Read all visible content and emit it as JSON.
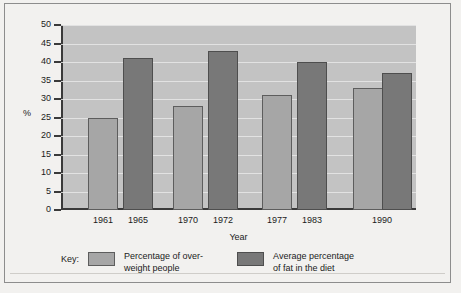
{
  "chart_data": {
    "type": "bar",
    "title": "",
    "xlabel": "Year",
    "ylabel": "%",
    "ylim": [
      0,
      50
    ],
    "ytick_step": 5,
    "yticks": [
      50,
      45,
      40,
      35,
      30,
      25,
      20,
      15,
      10,
      5,
      0
    ],
    "grid": true,
    "legend_position": "bottom",
    "legend_title": "Key:",
    "categories": [
      "1961",
      "1965",
      "1970",
      "1972",
      "1977",
      "1983",
      "1990"
    ],
    "series": [
      {
        "name": "Percentage of over-weight people",
        "color": "#a6a6a6",
        "points": [
          {
            "x": "1961",
            "y": 25
          },
          {
            "x": "1970",
            "y": 28
          },
          {
            "x": "1977",
            "y": 31
          },
          {
            "x": "1990",
            "y": 33
          }
        ]
      },
      {
        "name": "Average percentage of fat in the diet",
        "color": "#787878",
        "points": [
          {
            "x": "1965",
            "y": 41
          },
          {
            "x": "1972",
            "y": 43
          },
          {
            "x": "1983",
            "y": 40
          },
          {
            "x": "1990",
            "y": 37
          }
        ]
      }
    ],
    "bars": [
      {
        "label": "1961",
        "value": 25,
        "series": "light"
      },
      {
        "label": "1965",
        "value": 41,
        "series": "dark"
      },
      {
        "label": "1970",
        "value": 28,
        "series": "light"
      },
      {
        "label": "1972",
        "value": 43,
        "series": "dark"
      },
      {
        "label": "1977",
        "value": 31,
        "series": "light"
      },
      {
        "label": "1983",
        "value": 40,
        "series": "dark"
      },
      {
        "label": "1990a",
        "value": 33,
        "series": "light"
      },
      {
        "label": "1990b",
        "value": 37,
        "series": "dark"
      }
    ]
  },
  "axes": {
    "y_title": "%",
    "x_title": "Year",
    "tick_labels": [
      "50",
      "45",
      "40",
      "35",
      "30",
      "25",
      "20",
      "15",
      "10",
      "5",
      "0"
    ],
    "x_tick_labels": [
      "1961",
      "1965",
      "1970",
      "1972",
      "1977",
      "1983",
      "1990"
    ]
  },
  "legend": {
    "title": "Key:",
    "entries": [
      {
        "label": "Percentage of over-\nweight people",
        "color": "#a6a6a6"
      },
      {
        "label": "Average percentage\nof fat in the diet",
        "color": "#787878"
      }
    ]
  },
  "colors": {
    "light_bar": "#a6a6a6",
    "dark_bar": "#787878",
    "plot_background": "#c3c3c3",
    "gridline": "#e8e8e8",
    "axis": "#3a3a3a",
    "page_background": "#f2f1ef"
  }
}
